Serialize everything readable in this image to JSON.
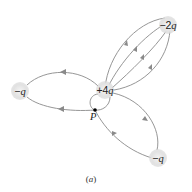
{
  "diagram": {
    "caption": "(a)",
    "charges": [
      {
        "id": "center",
        "label_sign": "+4",
        "label_var": "q",
        "cx": 105,
        "cy": 90
      },
      {
        "id": "top-right",
        "label_sign": "−2",
        "label_var": "q",
        "cx": 168,
        "cy": 25
      },
      {
        "id": "left",
        "label_sign": "−",
        "label_var": "q",
        "cx": 20,
        "cy": 91
      },
      {
        "id": "bottom-right",
        "label_sign": "−",
        "label_var": "q",
        "cx": 158,
        "cy": 158
      }
    ],
    "point": {
      "label": "P",
      "x": 95,
      "y": 110
    },
    "colors": {
      "line": "#8a8a8a",
      "charge_fill": "#e6e6e6",
      "point": "#000000"
    }
  }
}
